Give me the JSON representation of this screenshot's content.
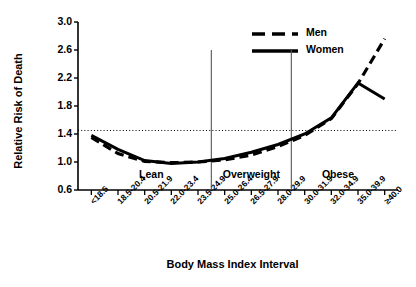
{
  "chart_data": {
    "type": "line",
    "title": "",
    "xlabel": "Body Mass Index Interval",
    "ylabel": "Relative Risk of Death",
    "categories": [
      "<18.5",
      "18.5-20.4",
      "20.5-21.9",
      "22.0-23.4",
      "23.5-24.9",
      "25.0-26.4",
      "26.5-27.9",
      "28.0-29.9",
      "30.0-31.9",
      "32.0-34.9",
      "35.0-39.9",
      "≥40.0"
    ],
    "ylim": [
      0.6,
      3.0
    ],
    "yticks": [
      "0.6",
      "1.0",
      "1.4",
      "1.8",
      "2.2",
      "2.6",
      "3.0"
    ],
    "ytick_values": [
      0.6,
      1.0,
      1.4,
      1.8,
      2.2,
      2.6,
      3.0
    ],
    "grid": false,
    "legend_position": "top-right",
    "series": [
      {
        "name": "Men",
        "style": "dashed",
        "values": [
          1.35,
          1.12,
          1.01,
          0.99,
          1.0,
          1.03,
          1.1,
          1.22,
          1.38,
          1.62,
          2.12,
          2.76
        ]
      },
      {
        "name": "Women",
        "style": "solid",
        "values": [
          1.38,
          1.18,
          1.02,
          0.98,
          1.0,
          1.05,
          1.14,
          1.25,
          1.4,
          1.63,
          2.13,
          1.9
        ]
      }
    ],
    "reference_line": {
      "value": 1.45,
      "style": "dotted",
      "label": ""
    },
    "region_dividers": [
      4.5,
      7.5
    ],
    "regions": [
      {
        "label": "Lean",
        "from": 0,
        "to": 4.5
      },
      {
        "label": "Overweight",
        "from": 4.5,
        "to": 7.5
      },
      {
        "label": "Obese",
        "from": 7.5,
        "to": 11
      }
    ]
  },
  "legend": {
    "items": [
      {
        "label": "Men"
      },
      {
        "label": "Women"
      }
    ]
  },
  "colors": {
    "line": "#000000",
    "axis": "#000000",
    "background": "#ffffff",
    "divider": "#555555"
  }
}
